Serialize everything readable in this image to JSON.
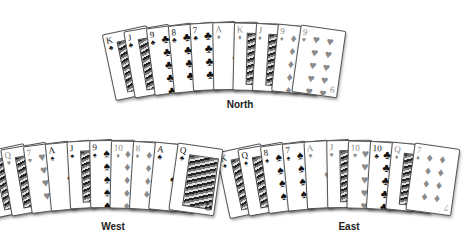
{
  "hands": {
    "north": {
      "label": "North",
      "cards": [
        {
          "rank": "K",
          "suit": "♣",
          "color": "black",
          "type": "face"
        },
        {
          "rank": "J",
          "suit": "♣",
          "color": "black",
          "type": "face"
        },
        {
          "rank": "9",
          "suit": "♣",
          "color": "black",
          "type": "pip"
        },
        {
          "rank": "8",
          "suit": "♣",
          "color": "black",
          "type": "pip"
        },
        {
          "rank": "7",
          "suit": "♣",
          "color": "black",
          "type": "pip"
        },
        {
          "rank": "A",
          "suit": "♦",
          "color": "red",
          "type": "ace"
        },
        {
          "rank": "K",
          "suit": "♦",
          "color": "red",
          "type": "face"
        },
        {
          "rank": "J",
          "suit": "♦",
          "color": "red",
          "type": "face"
        },
        {
          "rank": "9",
          "suit": "♦",
          "color": "red",
          "type": "pip"
        },
        {
          "rank": "9",
          "suit": "♥",
          "color": "red",
          "type": "pip"
        }
      ]
    },
    "west": {
      "label": "West",
      "cards": [
        {
          "rank": "K",
          "suit": "♥",
          "color": "red",
          "type": "face"
        },
        {
          "rank": "Q",
          "suit": "♥",
          "color": "red",
          "type": "face"
        },
        {
          "rank": "7",
          "suit": "♥",
          "color": "red",
          "type": "pip"
        },
        {
          "rank": "A",
          "suit": "♠",
          "color": "black",
          "type": "ace"
        },
        {
          "rank": "J",
          "suit": "♠",
          "color": "black",
          "type": "face"
        },
        {
          "rank": "9",
          "suit": "♠",
          "color": "black",
          "type": "pip"
        },
        {
          "rank": "10",
          "suit": "♦",
          "color": "red",
          "type": "pip"
        },
        {
          "rank": "8",
          "suit": "♦",
          "color": "red",
          "type": "pip"
        },
        {
          "rank": "A",
          "suit": "♣",
          "color": "black",
          "type": "ace"
        },
        {
          "rank": "Q",
          "suit": "♣",
          "color": "black",
          "type": "face"
        }
      ]
    },
    "east": {
      "label": "East",
      "cards": [
        {
          "rank": "K",
          "suit": "♠",
          "color": "black",
          "type": "face"
        },
        {
          "rank": "Q",
          "suit": "♠",
          "color": "black",
          "type": "face"
        },
        {
          "rank": "8",
          "suit": "♠",
          "color": "black",
          "type": "pip"
        },
        {
          "rank": "7",
          "suit": "♠",
          "color": "black",
          "type": "pip"
        },
        {
          "rank": "A",
          "suit": "♥",
          "color": "red",
          "type": "ace"
        },
        {
          "rank": "J",
          "suit": "♥",
          "color": "red",
          "type": "face"
        },
        {
          "rank": "10",
          "suit": "♥",
          "color": "red",
          "type": "pip"
        },
        {
          "rank": "10",
          "suit": "♣",
          "color": "black",
          "type": "pip"
        },
        {
          "rank": "Q",
          "suit": "♦",
          "color": "red",
          "type": "face"
        },
        {
          "rank": "7",
          "suit": "♦",
          "color": "red",
          "type": "pip"
        }
      ]
    }
  }
}
